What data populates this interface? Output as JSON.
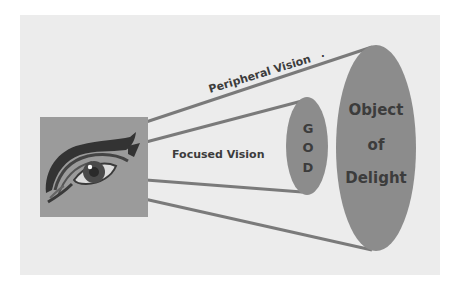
{
  "diagram": {
    "labels": {
      "peripheral_vision": "Peripheral Vision",
      "peripheral_dot": ".",
      "focused_vision": "Focused Vision",
      "god_letters": [
        "G",
        "O",
        "D"
      ],
      "object_of_delight": [
        "Object",
        "of",
        "Delight"
      ]
    },
    "nodes": [
      {
        "id": "eye",
        "shape": "square-image",
        "depicts": "eye-icon"
      },
      {
        "id": "god",
        "shape": "ellipse",
        "text": "GOD"
      },
      {
        "id": "object-of-delight",
        "shape": "ellipse",
        "text": "Object of Delight"
      }
    ],
    "edges": [
      {
        "from": "eye",
        "to": "object-of-delight",
        "label": "Peripheral Vision"
      },
      {
        "from": "eye",
        "to": "god",
        "label": "Focused Vision"
      }
    ],
    "colors": {
      "panel": "#ececec",
      "eye_box": "#9b9b9b",
      "ellipse": "#8c8c8c",
      "lines": "#7a7a7a",
      "text": "#3c3c3c",
      "eye_dark": "#333333"
    }
  }
}
